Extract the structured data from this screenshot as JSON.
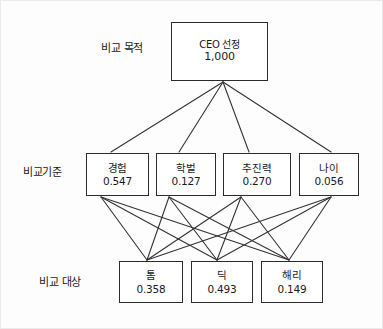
{
  "diagram": {
    "row_labels": [
      {
        "id": "goal-row",
        "text": "비교 목적"
      },
      {
        "id": "criteria-row",
        "text": "비교기준"
      },
      {
        "id": "alternatives-row",
        "text": "비교 대상"
      }
    ],
    "goal": {
      "label": "CEO 선정",
      "value": "1,000"
    },
    "criteria": [
      {
        "label": "경험",
        "value": "0.547"
      },
      {
        "label": "학벌",
        "value": "0.127"
      },
      {
        "label": "추진력",
        "value": "0.270"
      },
      {
        "label": "나이",
        "value": "0.056"
      }
    ],
    "alternatives": [
      {
        "label": "톰",
        "value": "0.358"
      },
      {
        "label": "딕",
        "value": "0.493"
      },
      {
        "label": "해리",
        "value": "0.149"
      }
    ],
    "colors": {
      "ink": "#2b2b2b",
      "text": "#1a1a1a",
      "background": "#fdfdfd",
      "line": "#333333"
    }
  }
}
